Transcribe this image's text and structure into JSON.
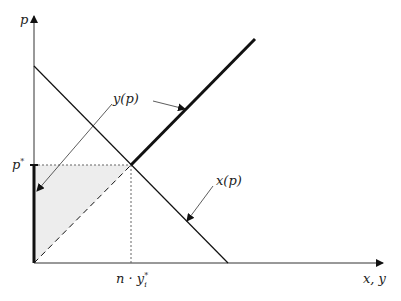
{
  "diagram": {
    "type": "supply-demand",
    "axes": {
      "y_label": "p",
      "x_label": "x, y"
    },
    "markers": {
      "price_star": "p",
      "price_star_sup": "*",
      "quantity_star": "n · y",
      "quantity_star_sub": "i",
      "quantity_star_sup": "*"
    },
    "curves": [
      {
        "name": "demand",
        "label": "x(p)"
      },
      {
        "name": "supply",
        "label": "y(p)"
      }
    ],
    "colors": {
      "line": "#111111",
      "shade": "#ededed",
      "guide": "#666666"
    }
  }
}
